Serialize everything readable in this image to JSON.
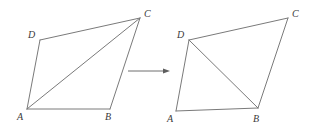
{
  "figure": {
    "stroke_color": "#7a7a7a",
    "arrow_color": "#5e5e5e",
    "label_color": "#3a3a3a",
    "background_color": "#ffffff"
  },
  "left_figure": {
    "name": "quadrilateral-with-diagonal-AC",
    "vertices": {
      "A": {
        "label": "A",
        "x": 27,
        "y": 109,
        "label_x": 17,
        "label_y": 112
      },
      "B": {
        "label": "B",
        "x": 110,
        "y": 109,
        "label_x": 105,
        "label_y": 112
      },
      "C": {
        "label": "C",
        "x": 140,
        "y": 18,
        "label_x": 144,
        "label_y": 9
      },
      "D": {
        "label": "D",
        "x": 40,
        "y": 40,
        "label_x": 28,
        "label_y": 30
      }
    },
    "edges": [
      "A-B",
      "B-C",
      "C-D",
      "D-A"
    ],
    "diagonal": "A-C"
  },
  "right_figure": {
    "name": "quadrilateral-with-diagonal-DB",
    "vertices": {
      "A": {
        "label": "A",
        "x": 176,
        "y": 111,
        "label_x": 167,
        "label_y": 114
      },
      "B": {
        "label": "B",
        "x": 258,
        "y": 108,
        "label_x": 253,
        "label_y": 114
      },
      "C": {
        "label": "C",
        "x": 288,
        "y": 18,
        "label_x": 292,
        "label_y": 9
      },
      "D": {
        "label": "D",
        "x": 189,
        "y": 40,
        "label_x": 177,
        "label_y": 30
      }
    },
    "edges": [
      "A-B",
      "B-C",
      "C-D",
      "D-A"
    ],
    "diagonal": "D-B"
  },
  "arrow": {
    "name": "transformation-arrow",
    "direction": "right",
    "x1": 128,
    "y1": 71,
    "x2": 170,
    "y2": 71
  }
}
